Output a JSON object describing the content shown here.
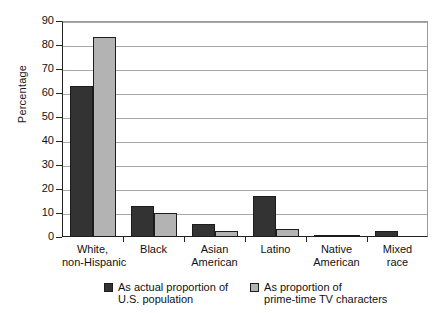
{
  "chart_data": {
    "type": "bar",
    "title": "",
    "xlabel": "",
    "ylabel": "Percentage",
    "ylim": [
      0,
      90
    ],
    "yticks": [
      0,
      10,
      20,
      30,
      40,
      50,
      60,
      70,
      80,
      90
    ],
    "ytick_labels": [
      "0",
      "10",
      "20",
      "30",
      "40",
      "50",
      "60",
      "70",
      "80",
      "90"
    ],
    "grid": true,
    "legend_position": "bottom",
    "categories": [
      "White, non-Hispanic",
      "Black",
      "Asian American",
      "Latino",
      "Native American",
      "Mixed race"
    ],
    "category_lines": [
      [
        "White,",
        "non-Hispanic"
      ],
      [
        "Black"
      ],
      [
        "Asian",
        "American"
      ],
      [
        "Latino"
      ],
      [
        "Native",
        "American"
      ],
      [
        "Mixed",
        "race"
      ]
    ],
    "series": [
      {
        "name": "As actual proportion of U.S. population",
        "name_lines": [
          "As actual proportion of",
          "U.S. population"
        ],
        "color": "#333333",
        "values": [
          63,
          13,
          5.4,
          17,
          1,
          2.3
        ]
      },
      {
        "name": "As proportion of prime-time TV characters",
        "name_lines": [
          "As proportion of",
          "prime-time TV characters"
        ],
        "color": "#b3b3b3",
        "values": [
          83.3,
          10,
          2.5,
          3.3,
          0.4,
          0
        ]
      }
    ]
  },
  "colors": {
    "series_actual": "#333333",
    "series_tv": "#b3b3b3",
    "axis": "#222222",
    "grid": "#a8a8a8",
    "background": "#ffffff"
  }
}
